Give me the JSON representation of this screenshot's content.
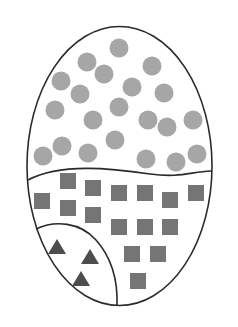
{
  "diagram": {
    "outline": {
      "cx": 119.5,
      "cy": 166,
      "rx": 92.5,
      "ry": 139.5,
      "stroke": "#2a2a2a"
    },
    "colors": {
      "circle": "#a6a6a6",
      "square": "#757575",
      "triangle": "#4d4d4d"
    },
    "regions": [
      {
        "name": "circles-region",
        "shape": "circle",
        "count": 21
      },
      {
        "name": "squares-region",
        "shape": "square",
        "count": 15
      },
      {
        "name": "triangles-region",
        "shape": "triangle",
        "count": 3
      }
    ],
    "circles": [
      [
        119,
        48
      ],
      [
        87,
        62
      ],
      [
        152,
        66
      ],
      [
        104,
        74
      ],
      [
        61,
        81
      ],
      [
        132,
        87
      ],
      [
        80,
        94
      ],
      [
        164,
        93
      ],
      [
        55,
        110
      ],
      [
        119,
        107
      ],
      [
        93,
        120
      ],
      [
        148,
        120
      ],
      [
        167,
        127
      ],
      [
        193,
        120
      ],
      [
        115,
        140
      ],
      [
        62,
        146
      ],
      [
        88,
        153
      ],
      [
        43,
        156
      ],
      [
        146,
        159
      ],
      [
        176,
        162
      ],
      [
        197,
        154
      ]
    ],
    "squares": [
      [
        68,
        181
      ],
      [
        93,
        188
      ],
      [
        42,
        201
      ],
      [
        68,
        208
      ],
      [
        119,
        193
      ],
      [
        145,
        193
      ],
      [
        170,
        200
      ],
      [
        196,
        193
      ],
      [
        93,
        215
      ],
      [
        119,
        227
      ],
      [
        145,
        227
      ],
      [
        170,
        227
      ],
      [
        132,
        254
      ],
      [
        158,
        254
      ],
      [
        138,
        281
      ]
    ],
    "triangles": [
      [
        57,
        247
      ],
      [
        90,
        257
      ],
      [
        81,
        279
      ]
    ]
  }
}
